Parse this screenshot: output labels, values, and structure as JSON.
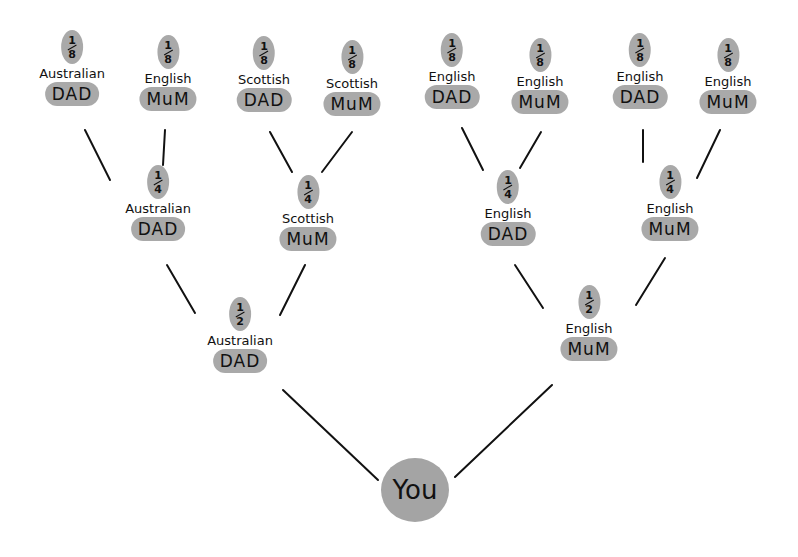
{
  "tree": {
    "you": "You",
    "colors": {
      "highlight": "#a9a9a9",
      "line": "#111111"
    },
    "generation_3": [
      {
        "fraction_num": "1",
        "fraction_den": "8",
        "nationality": "Australian",
        "role": "DAD"
      },
      {
        "fraction_num": "1",
        "fraction_den": "8",
        "nationality": "English",
        "role": "MuM"
      },
      {
        "fraction_num": "1",
        "fraction_den": "8",
        "nationality": "Scottish",
        "role": "DAD"
      },
      {
        "fraction_num": "1",
        "fraction_den": "8",
        "nationality": "Scottish",
        "role": "MuM"
      },
      {
        "fraction_num": "1",
        "fraction_den": "8",
        "nationality": "English",
        "role": "DAD"
      },
      {
        "fraction_num": "1",
        "fraction_den": "8",
        "nationality": "English",
        "role": "MuM"
      },
      {
        "fraction_num": "1",
        "fraction_den": "8",
        "nationality": "English",
        "role": "DAD"
      },
      {
        "fraction_num": "1",
        "fraction_den": "8",
        "nationality": "English",
        "role": "MuM"
      }
    ],
    "generation_2": [
      {
        "fraction_num": "1",
        "fraction_den": "4",
        "nationality": "Australian",
        "role": "DAD"
      },
      {
        "fraction_num": "1",
        "fraction_den": "4",
        "nationality": "Scottish",
        "role": "MuM"
      },
      {
        "fraction_num": "1",
        "fraction_den": "4",
        "nationality": "English",
        "role": "DAD"
      },
      {
        "fraction_num": "1",
        "fraction_den": "4",
        "nationality": "English",
        "role": "MuM"
      }
    ],
    "generation_1": [
      {
        "fraction_num": "1",
        "fraction_den": "2",
        "nationality": "Australian",
        "role": "DAD"
      },
      {
        "fraction_num": "1",
        "fraction_den": "2",
        "nationality": "English",
        "role": "MuM"
      }
    ]
  }
}
